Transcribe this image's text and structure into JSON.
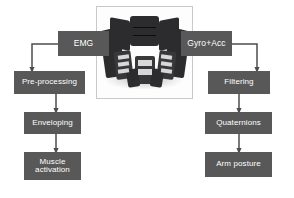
{
  "diagram": {
    "accent_color": "#585858",
    "text_color": "#ffffff",
    "connector_color": "#4d4d4d",
    "background_color": "#ffffff",
    "device": {
      "name": "myo-armband-photo",
      "caption": "",
      "frame_color": "#c9c9c9"
    },
    "sources": [
      {
        "id": "emg",
        "label": "EMG"
      },
      {
        "id": "gyro_acc",
        "label": "Gyro+Acc"
      }
    ],
    "left_pipeline": [
      {
        "id": "pre_processing",
        "label": "Pre-processing"
      },
      {
        "id": "enveloping",
        "label": "Enveloping"
      },
      {
        "id": "muscle_activation",
        "label": "Muscle\nactivation"
      }
    ],
    "right_pipeline": [
      {
        "id": "filtering",
        "label": "Filtering"
      },
      {
        "id": "quaternions",
        "label": "Quaternions"
      },
      {
        "id": "arm_posture",
        "label": "Arm posture"
      }
    ]
  }
}
